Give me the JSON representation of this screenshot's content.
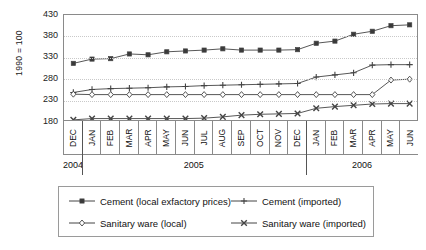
{
  "chart_data": {
    "type": "line",
    "title": "",
    "xlabel": "",
    "ylabel": "1990 = 100",
    "ylim": [
      180,
      430
    ],
    "yticks": [
      180,
      230,
      280,
      330,
      380,
      430
    ],
    "grid": true,
    "legend_position": "bottom",
    "categories": [
      "DEC",
      "JAN",
      "FEB",
      "MAR",
      "APR",
      "MAY",
      "JUN",
      "JUL",
      "AUG",
      "SEP",
      "OCT",
      "NOV",
      "DEC",
      "JAN",
      "FEB",
      "MAR",
      "APR",
      "MAY",
      "JUN"
    ],
    "year_groups": [
      {
        "label": "2004",
        "count": 1
      },
      {
        "label": "2005",
        "count": 12
      },
      {
        "label": "2006",
        "count": 6
      }
    ],
    "series": [
      {
        "name": "Cement (local exfactory prices)",
        "marker": "square",
        "values": [
          317,
          327,
          328,
          339,
          337,
          344,
          346,
          348,
          351,
          348,
          348,
          348,
          349,
          364,
          369,
          385,
          392,
          405,
          407
        ]
      },
      {
        "name": "Cement (imported)",
        "marker": "plus",
        "values": [
          249,
          256,
          258,
          259,
          260,
          262,
          263,
          265,
          266,
          267,
          268,
          269,
          270,
          285,
          290,
          295,
          313,
          314,
          314
        ]
      },
      {
        "name": "Sanitary ware (local)",
        "marker": "diamond",
        "values": [
          245,
          244,
          244,
          244,
          244,
          244,
          244,
          244,
          244,
          244,
          244,
          244,
          244,
          244,
          244,
          244,
          244,
          278,
          280
        ]
      },
      {
        "name": "Sanitary ware (imported)",
        "marker": "cross",
        "values": [
          185,
          188,
          188,
          188,
          188,
          188,
          188,
          189,
          192,
          196,
          198,
          199,
          200,
          212,
          216,
          219,
          222,
          223,
          223
        ]
      }
    ]
  },
  "legend": {
    "items": [
      {
        "label": "Cement (local exfactory prices)",
        "marker": "square"
      },
      {
        "label": "Cement (imported)",
        "marker": "plus"
      },
      {
        "label": "Sanitary ware (local)",
        "marker": "diamond"
      },
      {
        "label": "Sanitary ware (imported)",
        "marker": "cross"
      }
    ]
  },
  "colors": {
    "line": "#444444",
    "axis": "#8a8a8a",
    "grid": "#c9c9c9",
    "text": "#111111"
  }
}
